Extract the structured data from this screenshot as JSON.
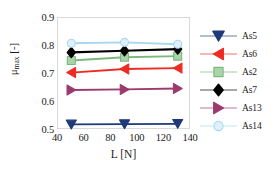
{
  "chart_data": {
    "type": "line",
    "title": "",
    "xlabel": "L [N]",
    "ylabel": "μmax [-]",
    "x": [
      50,
      90,
      130
    ],
    "xlim": [
      40,
      140
    ],
    "ylim": [
      0.5,
      0.9
    ],
    "xticks": [
      40,
      60,
      80,
      100,
      120,
      140
    ],
    "yticks": [
      0.5,
      0.6,
      0.7,
      0.8,
      0.9
    ],
    "grid": false,
    "legend_position": "right",
    "series": [
      {
        "name": "As5",
        "marker": "triangle-down",
        "color": "#1f3a7a",
        "values": [
          0.52,
          0.521,
          0.522
        ]
      },
      {
        "name": "As6",
        "marker": "triangle-left",
        "color": "#ee2b22",
        "values": [
          0.705,
          0.718,
          0.721
        ]
      },
      {
        "name": "As2",
        "marker": "square",
        "color": "#7cb87c",
        "values": [
          0.748,
          0.76,
          0.764
        ]
      },
      {
        "name": "As7",
        "marker": "diamond",
        "color": "#000000",
        "values": [
          0.777,
          0.783,
          0.789
        ]
      },
      {
        "name": "As13",
        "marker": "triangle-right",
        "color": "#9c3a6e",
        "values": [
          0.643,
          0.645,
          0.648
        ]
      },
      {
        "name": "As14",
        "marker": "circle",
        "color": "#a8d8f0",
        "values": [
          0.81,
          0.813,
          0.806
        ]
      }
    ]
  },
  "axes": {
    "y_tick_labels": [
      "0.9",
      "0.8",
      "0.7",
      "0.6",
      "0.5"
    ],
    "x_tick_labels": [
      "40",
      "60",
      "80",
      "100",
      "120",
      "140"
    ],
    "x_title": "L [N]",
    "y_title_main": "μ",
    "y_title_sub": "max",
    "y_title_unit": " [-]"
  },
  "legend": {
    "entries": [
      {
        "label": "As5"
      },
      {
        "label": "As6"
      },
      {
        "label": "As2"
      },
      {
        "label": "As7"
      },
      {
        "label": "As13"
      },
      {
        "label": "As14"
      }
    ]
  }
}
